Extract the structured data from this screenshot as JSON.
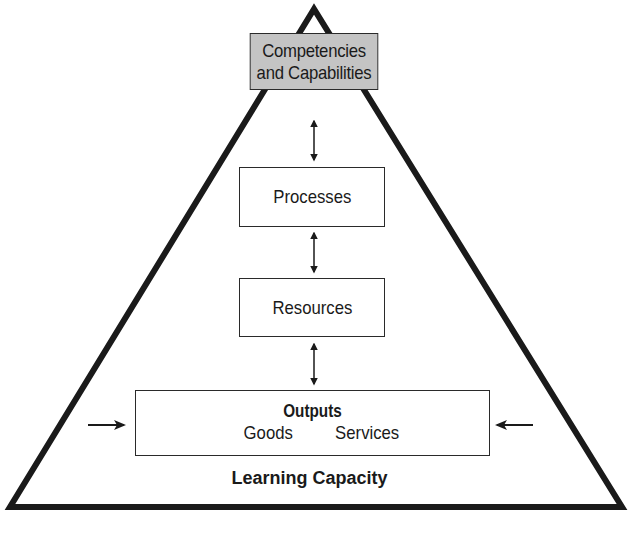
{
  "diagram": {
    "shape": "triangle",
    "colors": {
      "stroke": "#1a1a1a",
      "top_box_fill": "#c4c4c4",
      "box_fill": "#ffffff",
      "background": "#ffffff"
    },
    "top_box": {
      "line1": "Competencies",
      "line2": "and Capabilities"
    },
    "processes_box": {
      "label": "Processes"
    },
    "resources_box": {
      "label": "Resources"
    },
    "outputs_box": {
      "title": "Outputs",
      "items": [
        "Goods",
        "Services"
      ]
    },
    "base_label": "Learning Capacity",
    "connectors": [
      {
        "from": "Competencies and Capabilities",
        "to": "Processes",
        "type": "double-arrow"
      },
      {
        "from": "Processes",
        "to": "Resources",
        "type": "double-arrow"
      },
      {
        "from": "Resources",
        "to": "Outputs",
        "type": "double-arrow"
      }
    ],
    "side_arrows": [
      {
        "side": "left",
        "direction": "right",
        "points_to": "Outputs"
      },
      {
        "side": "right",
        "direction": "left",
        "points_to": "Outputs"
      }
    ]
  }
}
